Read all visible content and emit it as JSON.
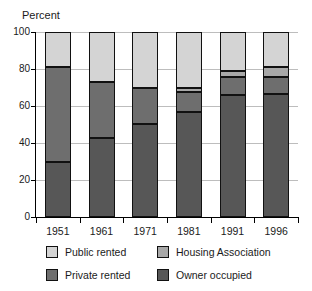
{
  "chart_data": {
    "type": "bar",
    "subtype": "stacked-bar-100-percent",
    "title": "",
    "ylabel": "Percent",
    "xlabel": "",
    "ylim": [
      0,
      100
    ],
    "yticks": [
      0,
      20,
      40,
      60,
      80,
      100
    ],
    "grid": true,
    "legend_position": "bottom",
    "categories": [
      "1951",
      "1961",
      "1971",
      "1981",
      "1991",
      "1996"
    ],
    "series": [
      {
        "name": "Owner occupied",
        "color": "#575757",
        "values": [
          29.5,
          42.5,
          50.5,
          56.5,
          66.0,
          66.5
        ]
      },
      {
        "name": "Private rented",
        "color": "#6e6e6e",
        "values": [
          51.5,
          30.5,
          19.0,
          11.0,
          9.5,
          9.0
        ]
      },
      {
        "name": "Housing Association",
        "color": "#a8a8a8",
        "values": [
          0,
          0,
          0,
          2.0,
          3.5,
          5.5
        ]
      },
      {
        "name": "Public rented",
        "color": "#d4d4d4",
        "values": [
          19.0,
          27.0,
          30.5,
          30.5,
          21.0,
          19.0
        ]
      }
    ],
    "stack_order_bottom_to_top": [
      "Owner occupied",
      "Private rented",
      "Housing Association",
      "Public rented"
    ]
  },
  "legend": {
    "items": [
      {
        "label": "Public rented",
        "color": "#d4d4d4"
      },
      {
        "label": "Housing Association",
        "color": "#a8a8a8"
      },
      {
        "label": "Private rented",
        "color": "#6e6e6e"
      },
      {
        "label": "Owner occupied",
        "color": "#575757"
      }
    ]
  },
  "axis": {
    "y_title": "Percent",
    "y_tick_labels": [
      "0",
      "20",
      "40",
      "60",
      "80",
      "100"
    ],
    "x_tick_labels": [
      "1951",
      "1961",
      "1971",
      "1981",
      "1991",
      "1996"
    ]
  }
}
